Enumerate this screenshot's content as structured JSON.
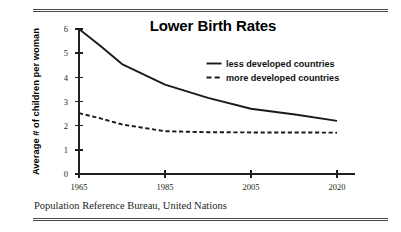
{
  "figure": {
    "title": "Lower Birth Rates",
    "source_caption": "Population Reference Bureau, United Nations",
    "rule_color": "#4a4a4a",
    "ink_color": "#231f20"
  },
  "legend": {
    "position": "inside-upper-right",
    "entries": [
      {
        "label": "less developed countries",
        "style": "solid"
      },
      {
        "label": "more developed countries",
        "style": "dashed"
      }
    ]
  },
  "chart_data": {
    "type": "line",
    "title": "Lower Birth Rates",
    "xlabel": "",
    "ylabel": "Average # of children per woman",
    "x": [
      1965,
      1970,
      1975,
      1985,
      1995,
      2005,
      2013,
      2020
    ],
    "xtick_labels": [
      "1965",
      "1985",
      "2005",
      "2020"
    ],
    "xtick_values": [
      1965,
      1985,
      2005,
      2020
    ],
    "ytick_labels": [
      "0",
      "1",
      "2",
      "3",
      "4",
      "5",
      "6"
    ],
    "ytick_values": [
      0,
      1,
      2,
      3,
      4,
      5,
      6
    ],
    "ylim": [
      0,
      6
    ],
    "xlim": [
      1965,
      2020
    ],
    "grid": false,
    "series": [
      {
        "name": "less developed countries",
        "style": "solid",
        "values": [
          6.0,
          5.3,
          4.55,
          3.7,
          3.15,
          2.7,
          2.45,
          2.2
        ]
      },
      {
        "name": "more developed countries",
        "style": "dashed",
        "values": [
          2.52,
          2.3,
          2.05,
          1.77,
          1.73,
          1.72,
          1.72,
          1.71
        ]
      }
    ]
  }
}
